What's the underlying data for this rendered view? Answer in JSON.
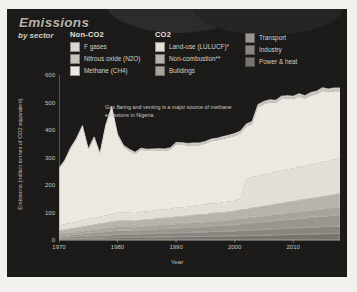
{
  "header": {
    "title": "Emissions",
    "subtitle": "by sector"
  },
  "legend": {
    "groups": [
      {
        "name": "Non-CO2",
        "items": [
          {
            "label": "F gases",
            "color": "#dedad2"
          },
          {
            "label": "Nitrous oxide (N2O)",
            "color": "#c9c5bc"
          },
          {
            "label": "Methane (CH4)",
            "color": "#f0ece4"
          }
        ]
      },
      {
        "name": "CO2",
        "items": [
          {
            "label": "Land-use (LULUCF)*",
            "color": "#e6e2da"
          },
          {
            "label": "Non-combustion**",
            "color": "#b9b5ac"
          },
          {
            "label": "Buildings",
            "color": "#a9a59c"
          }
        ]
      },
      {
        "name": "",
        "items": [
          {
            "label": "Transport",
            "color": "#9b978e"
          },
          {
            "label": "Industry",
            "color": "#8a8680"
          },
          {
            "label": "Power & heat",
            "color": "#77736d"
          }
        ]
      }
    ]
  },
  "annotation": "Gas flaring and venting is a major source of methane emissions in Nigeria.",
  "chart_data": {
    "type": "area",
    "title": "Emissions",
    "subtitle": "by sector",
    "xlabel": "Year",
    "ylabel": "Emissions (million tonnes of CO2 equivalent)",
    "xlim": [
      1970,
      2018
    ],
    "ylim": [
      0,
      600
    ],
    "xticks": [
      1970,
      1980,
      1990,
      2000,
      2010
    ],
    "yticks": [
      0,
      100,
      200,
      300,
      400,
      500,
      600
    ],
    "grid": false,
    "legend_position": "top",
    "stacked": true,
    "x": [
      1970,
      1971,
      1972,
      1973,
      1974,
      1975,
      1976,
      1977,
      1978,
      1979,
      1980,
      1981,
      1982,
      1983,
      1984,
      1985,
      1986,
      1987,
      1988,
      1989,
      1990,
      1991,
      1992,
      1993,
      1994,
      1995,
      1996,
      1997,
      1998,
      1999,
      2000,
      2001,
      2002,
      2003,
      2004,
      2005,
      2006,
      2007,
      2008,
      2009,
      2010,
      2011,
      2012,
      2013,
      2014,
      2015,
      2016,
      2017,
      2018
    ],
    "series": [
      {
        "name": "Power & heat",
        "color": "#77736d",
        "values": [
          4,
          4,
          5,
          5,
          6,
          6,
          7,
          7,
          8,
          8,
          9,
          9,
          9,
          9,
          10,
          10,
          10,
          11,
          11,
          11,
          12,
          12,
          12,
          13,
          13,
          13,
          14,
          14,
          14,
          15,
          15,
          16,
          16,
          17,
          17,
          18,
          18,
          19,
          19,
          20,
          20,
          21,
          21,
          22,
          22,
          23,
          23,
          24,
          24
        ]
      },
      {
        "name": "Industry",
        "color": "#8a8680",
        "values": [
          6,
          6,
          7,
          7,
          8,
          9,
          9,
          10,
          10,
          11,
          12,
          12,
          12,
          12,
          13,
          13,
          13,
          14,
          14,
          14,
          15,
          15,
          15,
          16,
          16,
          16,
          17,
          17,
          17,
          18,
          18,
          19,
          19,
          20,
          20,
          21,
          21,
          22,
          22,
          23,
          23,
          24,
          24,
          25,
          25,
          26,
          26,
          27,
          27
        ]
      },
      {
        "name": "Transport",
        "color": "#9b978e",
        "values": [
          5,
          6,
          7,
          8,
          9,
          10,
          11,
          12,
          13,
          14,
          15,
          15,
          15,
          14,
          14,
          15,
          15,
          16,
          16,
          17,
          17,
          18,
          18,
          19,
          19,
          20,
          21,
          21,
          22,
          22,
          23,
          24,
          25,
          26,
          27,
          28,
          29,
          30,
          31,
          32,
          33,
          34,
          35,
          36,
          37,
          38,
          39,
          40,
          41
        ]
      },
      {
        "name": "Buildings",
        "color": "#a9a59c",
        "values": [
          8,
          9,
          9,
          10,
          10,
          11,
          11,
          12,
          12,
          13,
          13,
          13,
          13,
          13,
          14,
          14,
          14,
          15,
          15,
          15,
          16,
          16,
          16,
          17,
          17,
          17,
          18,
          18,
          18,
          19,
          19,
          20,
          20,
          21,
          21,
          22,
          22,
          23,
          23,
          24,
          24,
          25,
          25,
          26,
          26,
          27,
          27,
          28,
          28
        ]
      },
      {
        "name": "Non-combustion**",
        "color": "#b9b5ac",
        "values": [
          12,
          13,
          14,
          15,
          16,
          17,
          18,
          19,
          20,
          21,
          22,
          22,
          22,
          22,
          23,
          23,
          24,
          24,
          25,
          25,
          26,
          26,
          27,
          27,
          28,
          28,
          29,
          29,
          30,
          30,
          31,
          32,
          33,
          34,
          35,
          36,
          37,
          38,
          39,
          40,
          41,
          42,
          43,
          44,
          45,
          46,
          47,
          48,
          49
        ]
      },
      {
        "name": "Land-use (LULUCF)*",
        "color": "#e6e2da",
        "values": [
          18,
          19,
          20,
          21,
          22,
          23,
          24,
          25,
          26,
          27,
          28,
          28,
          28,
          28,
          29,
          29,
          30,
          30,
          31,
          31,
          32,
          32,
          33,
          33,
          34,
          34,
          35,
          35,
          36,
          36,
          37,
          38,
          110,
          112,
          113,
          114,
          115,
          116,
          117,
          118,
          119,
          120,
          121,
          122,
          123,
          124,
          125,
          126,
          127
        ]
      },
      {
        "name": "Methane (CH4)",
        "color": "#f0ece4",
        "values": [
          205,
          230,
          270,
          300,
          340,
          250,
          290,
          225,
          325,
          385,
          280,
          240,
          225,
          215,
          225,
          220,
          218,
          215,
          212,
          215,
          230,
          228,
          222,
          220,
          218,
          222,
          225,
          228,
          230,
          232,
          235,
          238,
          190,
          192,
          250,
          255,
          258,
          250,
          262,
          258,
          252,
          255,
          245,
          250,
          252,
          258,
          250,
          248,
          245
        ]
      },
      {
        "name": "Nitrous oxide (N2O)",
        "color": "#c9c5bc",
        "values": [
          4,
          4,
          4,
          4,
          5,
          5,
          5,
          5,
          5,
          6,
          6,
          6,
          6,
          6,
          6,
          6,
          7,
          7,
          7,
          7,
          7,
          7,
          8,
          8,
          8,
          8,
          8,
          8,
          9,
          9,
          9,
          9,
          9,
          9,
          10,
          10,
          10,
          10,
          10,
          10,
          11,
          11,
          11,
          11,
          11,
          12,
          12,
          12,
          12
        ]
      },
      {
        "name": "F gases",
        "color": "#dedad2",
        "values": [
          0,
          0,
          0,
          0,
          0,
          0,
          0,
          0,
          0,
          0,
          0,
          0,
          0,
          0,
          0,
          0,
          0,
          0,
          0,
          0,
          0,
          0,
          0,
          0,
          0,
          0,
          0,
          0,
          0,
          0,
          0,
          0,
          0,
          0,
          0,
          0,
          0,
          0,
          0,
          0,
          0,
          0,
          0,
          0,
          0,
          0,
          0,
          0,
          0
        ]
      }
    ]
  }
}
